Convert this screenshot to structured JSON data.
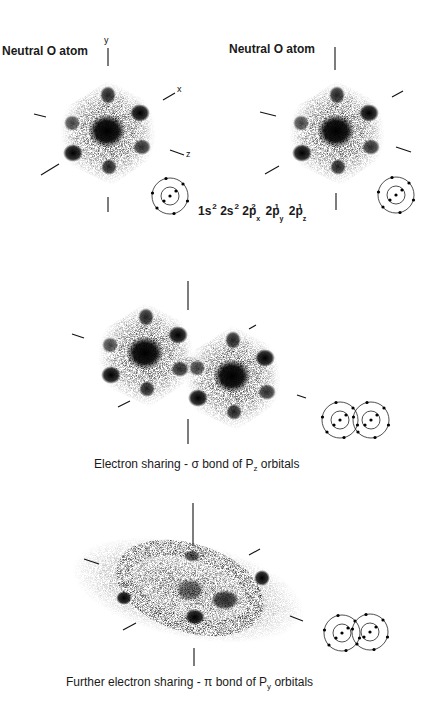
{
  "figure": {
    "title_left": "Neutral O atom",
    "title_right": "Neutral O atom",
    "axes": {
      "y": "y",
      "x": "x",
      "z": "z"
    },
    "electron_configuration": {
      "parts": [
        {
          "base": "1s",
          "sup": "2",
          "sub": ""
        },
        {
          "base": "2s",
          "sup": "2",
          "sub": ""
        },
        {
          "base": "2p",
          "sup": "2",
          "sub": "x"
        },
        {
          "base": "2p",
          "sup": "1",
          "sub": "y"
        },
        {
          "base": "2p",
          "sup": "1",
          "sub": "z"
        }
      ]
    },
    "sigma_caption": {
      "prefix": "Electron sharing - ",
      "symbol": "σ",
      "mid": " bond of P",
      "sub": "z",
      "suffix": " orbitals"
    },
    "pi_caption": {
      "prefix": "Further electron sharing  - ",
      "symbol": "π",
      "mid": " bond of P",
      "sub": "y",
      "suffix": " orbitals"
    },
    "colors": {
      "background": "#ffffff",
      "ink": "#111111",
      "cloud": "#222222"
    }
  }
}
